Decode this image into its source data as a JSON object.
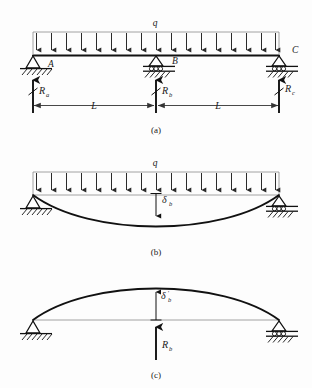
{
  "figure": {
    "background_color": "#fdfdfd",
    "line_color": "#111111",
    "load_line_color": "#8c8c8c"
  },
  "panels": [
    {
      "id": "a",
      "caption": "(a)",
      "description": "Two-span continuous beam with uniform load and three reactions",
      "load_label": "q",
      "node_labels": [
        "A",
        "B",
        "C"
      ],
      "reactions": [
        {
          "symbol": "R",
          "subscript": "a",
          "direction": "up"
        },
        {
          "symbol": "R",
          "subscript": "b",
          "direction": "up"
        },
        {
          "symbol": "R",
          "subscript": "c",
          "direction": "up"
        }
      ],
      "dimensions": [
        {
          "label": "L"
        },
        {
          "label": "L"
        }
      ],
      "supports": [
        "pin",
        "roller",
        "roller"
      ],
      "load_arrow_count": 17
    },
    {
      "id": "b",
      "caption": "(b)",
      "description": "Released beam under uniform load sagging downward",
      "load_label": "q",
      "deflection": {
        "symbol": "δ",
        "subscript": "b",
        "prime": "",
        "direction": "down"
      },
      "supports": [
        "pin",
        "roller"
      ],
      "load_arrow_count": 17
    },
    {
      "id": "c",
      "caption": "(c)",
      "description": "Released beam under redundant reaction deflecting upward",
      "deflection": {
        "symbol": "δ",
        "subscript": "b",
        "prime": "′",
        "direction": "up"
      },
      "reaction": {
        "symbol": "R",
        "subscript": "b",
        "direction": "up"
      },
      "supports": [
        "pin",
        "roller"
      ]
    }
  ]
}
